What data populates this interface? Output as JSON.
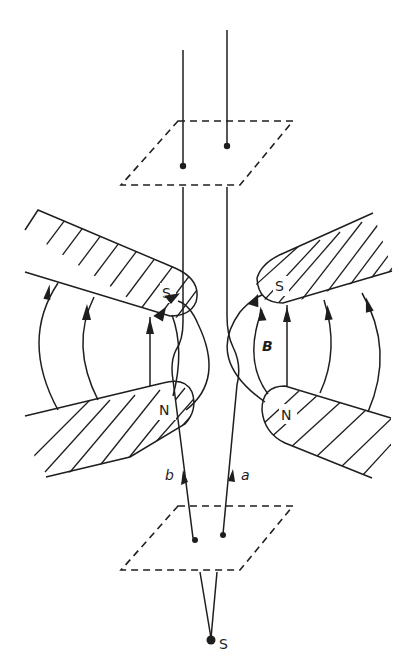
{
  "diagram": {
    "labels": {
      "source": "S",
      "beam_a": "a",
      "beam_b": "b",
      "field": "B",
      "left_upper_pole": "S",
      "left_lower_pole": "N",
      "right_upper_pole": "S",
      "right_lower_pole": "N"
    },
    "colors": {
      "ink": "#1e1e1e",
      "background": "#ffffff"
    }
  }
}
